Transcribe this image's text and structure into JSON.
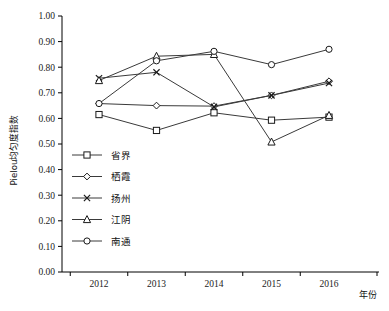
{
  "chart_data": {
    "type": "line",
    "title": "",
    "xlabel": "年份",
    "ylabel": "Pielou均匀度指数",
    "categories": [
      "2012",
      "2013",
      "2014",
      "2015",
      "2016"
    ],
    "x": [
      2012,
      2013,
      2014,
      2015,
      2016
    ],
    "ylim": [
      0.0,
      1.0
    ],
    "ytick_labels": [
      "0.00",
      "0.10",
      "0.20",
      "0.30",
      "0.40",
      "0.50",
      "0.60",
      "0.70",
      "0.80",
      "0.90",
      "1.00"
    ],
    "ytick_values": [
      0.0,
      0.1,
      0.2,
      0.3,
      0.4,
      0.5,
      0.6,
      0.7,
      0.8,
      0.9,
      1.0
    ],
    "grid": false,
    "legend_position": "inside-left-lower",
    "series": [
      {
        "name": "省界",
        "marker": "square",
        "values": [
          0.615,
          0.553,
          0.622,
          0.593,
          0.605
        ]
      },
      {
        "name": "栖霞",
        "marker": "diamond",
        "values": [
          0.658,
          0.65,
          0.648,
          0.69,
          0.745
        ]
      },
      {
        "name": "扬州",
        "marker": "cross",
        "values": [
          0.757,
          0.78,
          0.645,
          0.69,
          0.738
        ]
      },
      {
        "name": "江阴",
        "marker": "triangle",
        "values": [
          0.748,
          0.843,
          0.85,
          0.508,
          0.612
        ]
      },
      {
        "name": "南通",
        "marker": "circle",
        "values": [
          0.658,
          0.825,
          0.862,
          0.81,
          0.87
        ]
      }
    ]
  }
}
